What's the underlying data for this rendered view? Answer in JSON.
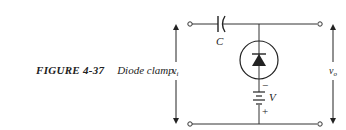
{
  "figure": {
    "number": "FIGURE 4-37",
    "title": "Diode clamp."
  },
  "circuit": {
    "components": {
      "capacitor": {
        "label": "C"
      },
      "diode": {
        "label": ""
      },
      "battery": {
        "label": "V",
        "minus": "−",
        "plus": "+"
      }
    },
    "input_voltage": {
      "label": "v",
      "subscript": "i"
    },
    "output_voltage": {
      "label": "v",
      "subscript": "o"
    }
  },
  "colors": {
    "ink": "#222222",
    "background": "#ffffff"
  }
}
